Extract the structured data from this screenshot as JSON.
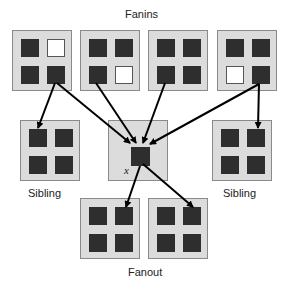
{
  "labels": {
    "fanins": "Fanins",
    "sibling_left": "Sibling",
    "sibling_right": "Sibling",
    "fanout": "Fanout",
    "center_node": "x"
  },
  "colors": {
    "box_fill": "#dcdcdc",
    "box_border": "#8a8a8a",
    "cell_filled": "#2e2e2e",
    "cell_empty": "#ffffff",
    "arrow": "#000000"
  },
  "nodes": {
    "fanins": [
      {
        "cells": [
          "filled",
          "empty",
          "filled",
          "filled"
        ]
      },
      {
        "cells": [
          "filled",
          "filled",
          "filled",
          "empty"
        ]
      },
      {
        "cells": [
          "filled",
          "filled",
          "filled",
          "filled"
        ]
      },
      {
        "cells": [
          "filled",
          "filled",
          "empty",
          "filled"
        ]
      }
    ],
    "siblings": [
      {
        "cells": [
          "filled",
          "filled",
          "filled",
          "filled"
        ]
      },
      {
        "cells": [
          "filled",
          "filled",
          "filled",
          "filled"
        ]
      }
    ],
    "fanouts": [
      {
        "cells": [
          "filled",
          "filled",
          "filled",
          "filled"
        ]
      },
      {
        "cells": [
          "filled",
          "filled",
          "filled",
          "filled"
        ]
      }
    ]
  },
  "edges": [
    {
      "from": "fanin-1",
      "to": "sibling-left"
    },
    {
      "from": "fanin-1",
      "to": "x"
    },
    {
      "from": "fanin-2",
      "to": "x"
    },
    {
      "from": "fanin-3",
      "to": "x"
    },
    {
      "from": "fanin-4",
      "to": "x"
    },
    {
      "from": "fanin-4",
      "to": "sibling-right"
    },
    {
      "from": "x",
      "to": "fanout-1"
    },
    {
      "from": "x",
      "to": "fanout-2"
    }
  ]
}
